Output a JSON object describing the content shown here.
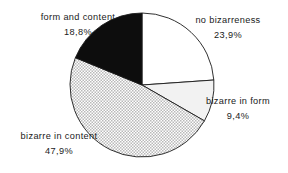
{
  "chart_data": {
    "type": "pie",
    "title": "",
    "subtitle": "",
    "legend_position": "outside-labels",
    "grid": false,
    "value_suffix": "%",
    "decimal_separator": ",",
    "start_angle_deg": 0,
    "direction": "clockwise",
    "categories": [
      "no bizarreness",
      "bizarre in form",
      "bizarre in content",
      "form and content"
    ],
    "values": [
      23.9,
      9.4,
      47.9,
      18.8
    ],
    "total": 100.0,
    "slices": [
      {
        "label": "no bizarreness",
        "value": 23.9,
        "value_text": "23,9%",
        "fill": "white",
        "fill_color": "#ffffff",
        "stroke_color": "#1a1a1a",
        "start_deg": 0.0,
        "end_deg": 86.04
      },
      {
        "label": "bizarre in form",
        "value": 9.4,
        "value_text": "9,4%",
        "fill": "light-gray",
        "fill_color": "#f2f2f2",
        "stroke_color": "#1a1a1a",
        "start_deg": 86.04,
        "end_deg": 119.88
      },
      {
        "label": "bizarre in content",
        "value": 47.9,
        "value_text": "47,9%",
        "fill": "halftone-dots",
        "fill_color": "#d8d8d8",
        "stroke_color": "#1a1a1a",
        "start_deg": 119.88,
        "end_deg": 292.32
      },
      {
        "label": "form and content",
        "value": 18.8,
        "value_text": "18,8%",
        "fill": "solid-black",
        "fill_color": "#0d0d0d",
        "stroke_color": "#1a1a1a",
        "start_deg": 292.32,
        "end_deg": 360.0
      }
    ]
  },
  "geometry": {
    "center_x": 142,
    "center_y": 85,
    "radius": 72
  },
  "colors": {
    "text": "#1a1a1a",
    "outline": "#1a1a1a",
    "background": "#ffffff"
  }
}
